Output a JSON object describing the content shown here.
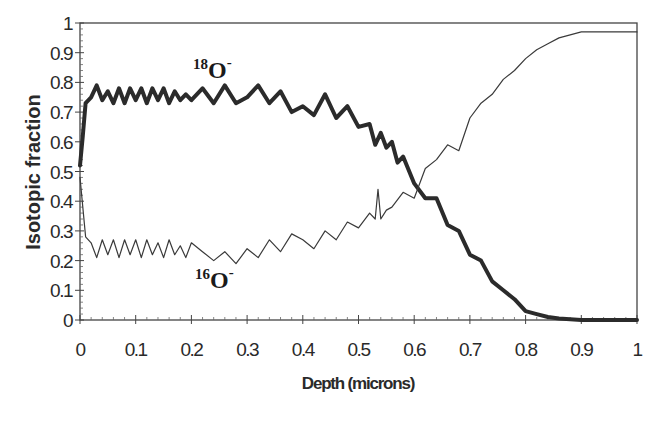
{
  "chart_data": {
    "type": "line",
    "title": "",
    "xlabel": "Depth (microns)",
    "ylabel": "Isotopic fraction",
    "xlim": [
      0,
      1
    ],
    "ylim": [
      0,
      1
    ],
    "grid": false,
    "legend": "inline labels",
    "x_ticks": [
      "0",
      "0.1",
      "0.2",
      "0.3",
      "0.4",
      "0.5",
      "0.6",
      "0.7",
      "0.8",
      "0.9",
      "1"
    ],
    "y_ticks": [
      "0",
      "0.1",
      "0.2",
      "0.3",
      "0.4",
      "0.5",
      "0.6",
      "0.7",
      "0.8",
      "0.9",
      "1"
    ],
    "series": [
      {
        "name": "18O-",
        "label_mass": "18",
        "label_element": "O",
        "label_charge": "-",
        "style": "thick",
        "color": "#2b2b2b",
        "x": [
          0.0,
          0.005,
          0.01,
          0.02,
          0.03,
          0.04,
          0.05,
          0.06,
          0.07,
          0.08,
          0.09,
          0.1,
          0.11,
          0.12,
          0.13,
          0.14,
          0.15,
          0.16,
          0.17,
          0.18,
          0.19,
          0.2,
          0.22,
          0.24,
          0.26,
          0.28,
          0.3,
          0.32,
          0.34,
          0.36,
          0.38,
          0.4,
          0.42,
          0.44,
          0.46,
          0.48,
          0.5,
          0.52,
          0.53,
          0.54,
          0.55,
          0.56,
          0.57,
          0.58,
          0.6,
          0.62,
          0.64,
          0.66,
          0.68,
          0.7,
          0.72,
          0.74,
          0.76,
          0.78,
          0.8,
          0.82,
          0.84,
          0.86,
          0.9,
          0.95,
          1.0
        ],
        "values": [
          0.52,
          0.62,
          0.73,
          0.75,
          0.79,
          0.74,
          0.77,
          0.73,
          0.78,
          0.73,
          0.78,
          0.74,
          0.78,
          0.73,
          0.78,
          0.74,
          0.78,
          0.73,
          0.77,
          0.74,
          0.76,
          0.74,
          0.78,
          0.73,
          0.79,
          0.73,
          0.75,
          0.79,
          0.73,
          0.77,
          0.7,
          0.72,
          0.69,
          0.76,
          0.68,
          0.72,
          0.65,
          0.66,
          0.59,
          0.63,
          0.58,
          0.6,
          0.53,
          0.55,
          0.46,
          0.41,
          0.41,
          0.32,
          0.3,
          0.22,
          0.2,
          0.13,
          0.1,
          0.07,
          0.03,
          0.02,
          0.01,
          0.005,
          0.0,
          0.0,
          0.0
        ]
      },
      {
        "name": "16O-",
        "label_mass": "16",
        "label_element": "O",
        "label_charge": "-",
        "style": "thin",
        "color": "#3a3a3a",
        "x": [
          0.0,
          0.005,
          0.01,
          0.02,
          0.03,
          0.04,
          0.05,
          0.06,
          0.07,
          0.08,
          0.09,
          0.1,
          0.11,
          0.12,
          0.13,
          0.14,
          0.15,
          0.16,
          0.17,
          0.18,
          0.19,
          0.2,
          0.22,
          0.24,
          0.26,
          0.28,
          0.3,
          0.32,
          0.34,
          0.36,
          0.38,
          0.4,
          0.42,
          0.44,
          0.46,
          0.48,
          0.5,
          0.52,
          0.53,
          0.535,
          0.54,
          0.55,
          0.56,
          0.58,
          0.6,
          0.62,
          0.64,
          0.66,
          0.68,
          0.7,
          0.72,
          0.74,
          0.76,
          0.78,
          0.8,
          0.82,
          0.84,
          0.86,
          0.88,
          0.9,
          0.95,
          1.0
        ],
        "values": [
          0.48,
          0.38,
          0.28,
          0.26,
          0.21,
          0.27,
          0.22,
          0.27,
          0.21,
          0.27,
          0.22,
          0.27,
          0.21,
          0.27,
          0.22,
          0.26,
          0.21,
          0.27,
          0.22,
          0.25,
          0.21,
          0.26,
          0.23,
          0.2,
          0.23,
          0.19,
          0.24,
          0.21,
          0.27,
          0.23,
          0.29,
          0.27,
          0.24,
          0.3,
          0.27,
          0.33,
          0.31,
          0.36,
          0.34,
          0.44,
          0.34,
          0.37,
          0.38,
          0.43,
          0.41,
          0.51,
          0.54,
          0.59,
          0.57,
          0.68,
          0.73,
          0.76,
          0.81,
          0.84,
          0.88,
          0.91,
          0.93,
          0.95,
          0.96,
          0.97,
          0.97,
          0.97
        ]
      }
    ]
  },
  "labels": {
    "xlabel": "Depth (microns)",
    "ylabel": "Isotopic fraction",
    "series_18": {
      "mass": "18",
      "element": "O",
      "charge": "-"
    },
    "series_16": {
      "mass": "16",
      "element": "O",
      "charge": "-"
    }
  }
}
